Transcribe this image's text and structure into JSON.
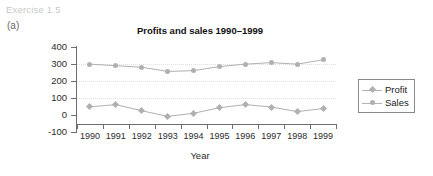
{
  "exercise": {
    "label": "Exercise 1.5",
    "part": "(a)"
  },
  "chart_data": {
    "type": "line",
    "title": "Profits and sales 1990–1999",
    "xlabel": "Year",
    "ylabel": "Profits and sales",
    "categories": [
      "1990",
      "1991",
      "1992",
      "1993",
      "1994",
      "1995",
      "1996",
      "1997",
      "1998",
      "1999"
    ],
    "series": [
      {
        "name": "Profit",
        "marker": "diamond",
        "color": "#b0b0b0",
        "values": [
          48,
          61,
          25,
          -8,
          10,
          43,
          61,
          47,
          20,
          38
        ]
      },
      {
        "name": "Sales",
        "marker": "circle",
        "color": "#b0b0b0",
        "values": [
          299,
          290,
          281,
          256,
          261,
          285,
          299,
          308,
          299,
          325
        ]
      }
    ],
    "ylim": [
      -100,
      400
    ],
    "yticks": [
      "400",
      "300",
      "200",
      "100",
      "0",
      "-100"
    ],
    "ytick_values": [
      400,
      300,
      200,
      100,
      0,
      -100
    ],
    "gridlines": [
      300,
      200,
      100
    ],
    "grid": true,
    "legend_position": "right"
  },
  "legend": {
    "entries": [
      {
        "label": "Profit",
        "marker": "diamond"
      },
      {
        "label": "Sales",
        "marker": "circle"
      }
    ]
  }
}
